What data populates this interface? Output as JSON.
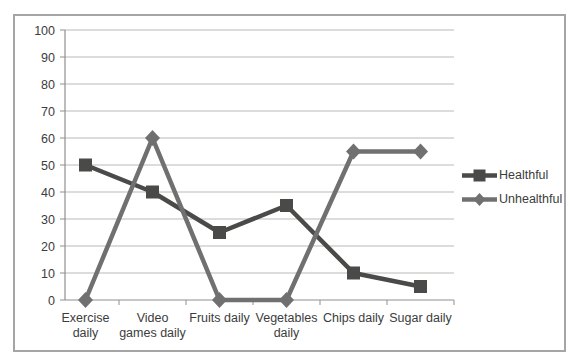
{
  "chart_data": {
    "type": "line",
    "title": "",
    "categories": [
      "Exercise daily",
      "Video games daily",
      "Fruits daily",
      "Vegetables daily",
      "Chips daily",
      "Sugar daily"
    ],
    "category_label_lines": [
      [
        "Exercise",
        "daily"
      ],
      [
        "Video",
        "games daily"
      ],
      [
        "Fruits daily"
      ],
      [
        "Vegetables",
        "daily"
      ],
      [
        "Chips daily"
      ],
      [
        "Sugar daily"
      ]
    ],
    "series": [
      {
        "name": "Healthful",
        "marker": "square",
        "color": "#4a4a49",
        "values": [
          50,
          40,
          25,
          35,
          10,
          5
        ]
      },
      {
        "name": "Unhealthful",
        "marker": "diamond",
        "color": "#707070",
        "values": [
          0,
          60,
          0,
          0,
          55,
          55
        ]
      }
    ],
    "xlabel": "",
    "ylabel": "",
    "ylim": [
      0,
      100
    ],
    "yticks": [
      0,
      10,
      20,
      30,
      40,
      50,
      60,
      70,
      80,
      90,
      100
    ],
    "grid": true,
    "legend_position": "right"
  },
  "styles": {
    "gridline_color": "#b9b9b9",
    "axis_color": "#8f8f8f",
    "label_color": "#3c3c3c",
    "frame_border_color": "#a5a5a5",
    "background_color": "#ffffff"
  }
}
